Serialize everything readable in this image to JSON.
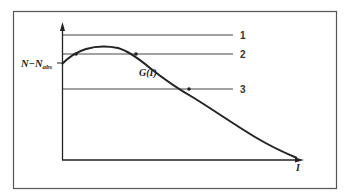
{
  "diagram": {
    "y_label_main": "N−N",
    "y_label_sub": "abs",
    "curve_label": "G(I)",
    "x_label": "I",
    "lines": [
      {
        "id": "1",
        "label": "1",
        "y": 35
      },
      {
        "id": "2",
        "label": "2",
        "y": 54
      },
      {
        "id": "3",
        "label": "3",
        "y": 89
      }
    ],
    "colors": {
      "stroke": "#222222",
      "frame": "#555555",
      "background": "#ffffff"
    }
  }
}
